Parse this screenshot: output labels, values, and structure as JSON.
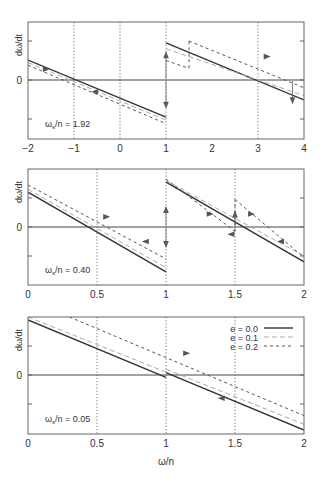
{
  "chart_data": [
    {
      "type": "line",
      "panel": 1,
      "title": "",
      "xlabel": "",
      "ylabel": "dω/dt",
      "annotation": {
        "text": "ω_s/n = 1.92",
        "main": "ω",
        "sub": "s",
        "rest": "/n = 1.92"
      },
      "xlim": [
        -2,
        4
      ],
      "xticks": [
        -2,
        -1,
        0,
        1,
        2,
        3,
        4
      ],
      "xtick_labels": [
        "−2",
        "−1",
        "0",
        "1",
        "2",
        "3",
        "4"
      ],
      "ylim": [
        -1.5,
        1.5
      ],
      "yticks": [
        -1,
        0,
        1
      ],
      "ytick_labels": [
        "",
        "0",
        ""
      ],
      "vgrid": [
        -1,
        0,
        1,
        3
      ],
      "zero_line": true,
      "series": [
        {
          "name": "e = 0.0",
          "style": "solid",
          "segments": [
            [
              [
                -2,
                0.51
              ],
              [
                1,
                -0.95
              ]
            ],
            [
              [
                1,
                0.95
              ],
              [
                4,
                -0.51
              ]
            ]
          ]
        },
        {
          "name": "e = 0.1",
          "style": "longdash",
          "segments": [
            [
              [
                -2,
                0.45
              ],
              [
                1,
                -1.03
              ]
            ],
            [
              [
                1,
                0.8
              ],
              [
                4,
                -0.4
              ]
            ]
          ]
        },
        {
          "name": "e = 0.2",
          "style": "shortdash",
          "segments": [
            [
              [
                -2,
                0.38
              ],
              [
                1,
                -1.12
              ]
            ],
            [
              [
                1,
                0.5
              ],
              [
                1.5,
                0.3
              ]
            ],
            [
              [
                1.5,
                1.0
              ],
              [
                4,
                -0.2
              ]
            ]
          ]
        }
      ],
      "arrows": [
        {
          "x": -1.6,
          "y": 0.28,
          "dir": "right"
        },
        {
          "x": -0.55,
          "y": -0.3,
          "dir": "left"
        },
        {
          "x": 1,
          "y": 0.65,
          "dir": "up"
        },
        {
          "x": 1,
          "y": -0.65,
          "dir": "down"
        },
        {
          "x": 3.2,
          "y": 0.6,
          "dir": "right"
        },
        {
          "x": 3.75,
          "y": -0.53,
          "dir": "down"
        }
      ]
    },
    {
      "type": "line",
      "panel": 2,
      "title": "",
      "xlabel": "",
      "ylabel": "dω/dt",
      "annotation": {
        "text": "ω_s/n = 0.40",
        "main": "ω",
        "sub": "s",
        "rest": "/n = 0.40"
      },
      "xlim": [
        0,
        2
      ],
      "xticks": [
        0,
        0.5,
        1,
        1.5,
        2
      ],
      "xtick_labels": [
        "0",
        "0.5",
        "1",
        "1.5",
        "2"
      ],
      "ylim": [
        -2,
        2
      ],
      "yticks": [
        -1,
        0,
        1
      ],
      "ytick_labels": [
        "",
        "0",
        ""
      ],
      "vgrid": [
        0.5,
        1,
        1.5
      ],
      "zero_line": true,
      "series": [
        {
          "name": "e = 0.0",
          "style": "solid",
          "segments": [
            [
              [
                0,
                1.2
              ],
              [
                1,
                -1.55
              ]
            ],
            [
              [
                1,
                1.55
              ],
              [
                2,
                -1.2
              ]
            ]
          ]
        },
        {
          "name": "e = 0.1",
          "style": "longdash",
          "segments": [
            [
              [
                0,
                1.3
              ],
              [
                1,
                -1.4
              ]
            ],
            [
              [
                1,
                1.6
              ],
              [
                2,
                -1.0
              ]
            ]
          ]
        },
        {
          "name": "e = 0.2",
          "style": "shortdash",
          "segments": [
            [
              [
                0,
                1.45
              ],
              [
                1,
                -1.1
              ]
            ],
            [
              [
                1,
                1.65
              ],
              [
                1.5,
                -0.15
              ]
            ],
            [
              [
                1.5,
                0.95
              ],
              [
                2,
                -1.05
              ]
            ]
          ]
        }
      ],
      "arrows": [
        {
          "x": 0.57,
          "y": 0.35,
          "dir": "right"
        },
        {
          "x": 0.85,
          "y": -0.5,
          "dir": "left"
        },
        {
          "x": 1,
          "y": 0.6,
          "dir": "up"
        },
        {
          "x": 1,
          "y": -0.6,
          "dir": "down"
        },
        {
          "x": 1.32,
          "y": 0.45,
          "dir": "right"
        },
        {
          "x": 1.5,
          "y": 0.45,
          "dir": "up"
        },
        {
          "x": 1.47,
          "y": -0.25,
          "dir": "left"
        },
        {
          "x": 1.62,
          "y": 0.45,
          "dir": "right"
        },
        {
          "x": 1.83,
          "y": -0.5,
          "dir": "left"
        }
      ]
    },
    {
      "type": "line",
      "panel": 3,
      "title": "",
      "xlabel": "ω/n",
      "ylabel": "dω/dt",
      "annotation": {
        "text": "ω_s/n = 0.05",
        "main": "ω",
        "sub": "s",
        "rest": "/n = 0.05"
      },
      "xlim": [
        0,
        2
      ],
      "xticks": [
        0,
        0.5,
        1,
        1.5,
        2
      ],
      "xtick_labels": [
        "0",
        "0.5",
        "1",
        "1.5",
        "2"
      ],
      "ylim": [
        -2,
        2
      ],
      "yticks": [
        -1,
        0,
        1
      ],
      "ytick_labels": [
        "",
        "0",
        ""
      ],
      "vgrid": [
        0.5,
        1,
        1.5
      ],
      "zero_line": true,
      "legend": {
        "position": "upper right",
        "entries": [
          "e = 0.0",
          "e = 0.1",
          "e = 0.2"
        ]
      },
      "series": [
        {
          "name": "e = 0.0",
          "style": "solid",
          "segments": [
            [
              [
                0,
                1.9
              ],
              [
                1,
                -0.08
              ]
            ],
            [
              [
                1,
                0.08
              ],
              [
                2,
                -1.9
              ]
            ]
          ]
        },
        {
          "name": "e = 0.1",
          "style": "longdash",
          "segments": [
            [
              [
                0,
                2.0
              ],
              [
                1,
                0.1
              ]
            ],
            [
              [
                1,
                0.2
              ],
              [
                2,
                -1.7
              ]
            ]
          ]
        },
        {
          "name": "e = 0.2",
          "style": "shortdash",
          "segments": [
            [
              [
                0.3,
                2.0
              ],
              [
                2,
                -1.4
              ]
            ]
          ]
        }
      ],
      "arrows": [
        {
          "x": 1.15,
          "y": 0.75,
          "dir": "right"
        },
        {
          "x": 1.4,
          "y": -0.8,
          "dir": "left"
        }
      ]
    }
  ],
  "layout": {
    "panels": [
      {
        "x0": 28,
        "x1": 304,
        "y0": 22,
        "y1": 139,
        "yzero": 80,
        "yunit": 39
      },
      {
        "x0": 28,
        "x1": 304,
        "y0": 169,
        "y1": 285,
        "yzero": 227,
        "yunit": 29
      },
      {
        "x0": 28,
        "x1": 304,
        "y0": 317,
        "y1": 434,
        "yzero": 375,
        "yunit": 29
      }
    ]
  },
  "colors": {
    "e00": "#333333",
    "e01": "#aaaaaa",
    "e02": "#555555",
    "axis": "#555555",
    "grid": "#555555"
  }
}
